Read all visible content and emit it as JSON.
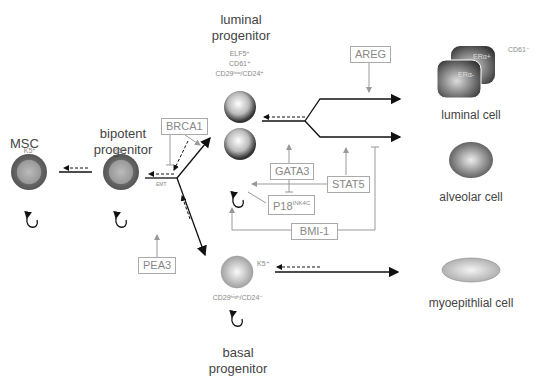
{
  "diagram": {
    "cells": {
      "msc": {
        "title": "MSC",
        "marker": "K5⁺"
      },
      "bipotent": {
        "title_line1": "bipotent",
        "title_line2": "progenitor",
        "marker": "K5⁺",
        "emt_label": "EMT"
      },
      "luminal_progenitor": {
        "title_line1": "luminal",
        "title_line2": "progenitor",
        "markers": [
          "ELF5⁺",
          "CD61⁺",
          "CD29ˡᵒʷ/CD24⁺"
        ]
      },
      "basal_progenitor": {
        "title_line1": "basal",
        "title_line2": "progenitor",
        "marker_side": "K5⁺",
        "marker_below": "CD29ʰⁱᵍʰ/CD24⁻"
      },
      "luminal_cell": {
        "label": "luminal cell",
        "er_pos": "ERα+",
        "er_neg": "ERα-",
        "marker": "CD61⁻"
      },
      "alveolar_cell": {
        "label": "alveolar cell"
      },
      "myoepithelial_cell": {
        "label": "myoepithlial cell"
      }
    },
    "regulators": {
      "brca1": "BRCA1",
      "pea3": "PEA3",
      "areg": "AREG",
      "gata3": "GATA3",
      "stat5": "STAT5",
      "p18": "P18",
      "p18_sup": "INK4C",
      "bmi1": "BMI-1"
    },
    "colors": {
      "arrow": "#111111",
      "regulator_line": "#999999",
      "box_border": "#aaaaaa"
    }
  }
}
